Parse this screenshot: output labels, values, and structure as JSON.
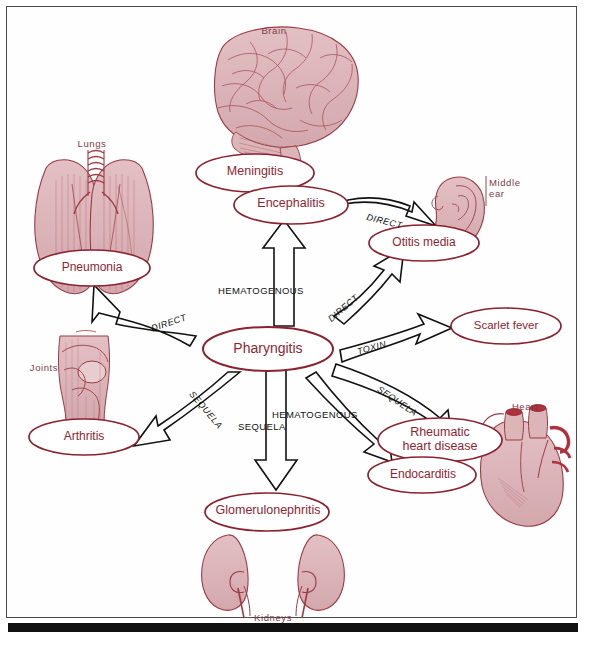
{
  "figure": {
    "frame_color": "#4a4a4a",
    "node_text_color": "#8f2430",
    "node_outline_color": "#8b2230",
    "organ_label_color": "#7d3b45",
    "edge_color": "#111111",
    "organ_fill_color": "#dcb5b9",
    "organ_line_color": "#9c3b44",
    "background_color": "#ffffff"
  },
  "organ_labels": [
    {
      "id": "brain",
      "text": "Brain"
    },
    {
      "id": "lungs",
      "text": "Lungs"
    },
    {
      "id": "middle_ear",
      "text": "Middle\near"
    },
    {
      "id": "joints",
      "text": "Joints"
    },
    {
      "id": "heart",
      "text": "Heart"
    },
    {
      "id": "kidneys",
      "text": "Kidneys"
    }
  ],
  "nodes": [
    {
      "id": "pharyngitis",
      "label": "Pharyngitis",
      "role": "central"
    },
    {
      "id": "meningitis",
      "label": "Meningitis",
      "role": "complication"
    },
    {
      "id": "encephalitis",
      "label": "Encephalitis",
      "role": "complication"
    },
    {
      "id": "otitis_media",
      "label": "Otitis media",
      "role": "complication"
    },
    {
      "id": "scarlet_fever",
      "label": "Scarlet fever",
      "role": "complication"
    },
    {
      "id": "pneumonia",
      "label": "Pneumonia",
      "role": "complication"
    },
    {
      "id": "arthritis",
      "label": "Arthritis",
      "role": "complication"
    },
    {
      "id": "rheumatic_hd",
      "label": "Rheumatic\nheart disease",
      "role": "complication"
    },
    {
      "id": "endocarditis",
      "label": "Endocarditis",
      "role": "complication"
    },
    {
      "id": "glomerulonephritis",
      "label": "Glomerulonephritis",
      "role": "complication"
    }
  ],
  "edges": [
    {
      "id": "e_brain",
      "from": "pharyngitis",
      "to": "encephalitis",
      "label": "HEMATOGENOUS"
    },
    {
      "id": "e_ear",
      "from": "pharyngitis",
      "to": "otitis_media",
      "label": "DIRECT"
    },
    {
      "id": "e_ear_upper",
      "from": "encephalitis",
      "to": "otitis_media",
      "label": "DIRECT"
    },
    {
      "id": "e_scarlet",
      "from": "pharyngitis",
      "to": "scarlet_fever",
      "label": "TOXIN"
    },
    {
      "id": "e_lungs",
      "from": "pharyngitis",
      "to": "pneumonia",
      "label": "DIRECT"
    },
    {
      "id": "e_joints",
      "from": "pharyngitis",
      "to": "arthritis",
      "label": "SEQUELA"
    },
    {
      "id": "e_rheumatic",
      "from": "pharyngitis",
      "to": "rheumatic_hd",
      "label": "SEQUELA"
    },
    {
      "id": "e_endocarditis",
      "from": "pharyngitis",
      "to": "endocarditis",
      "label": "HEMATOGENOUS"
    },
    {
      "id": "e_kidneys",
      "from": "pharyngitis",
      "to": "glomerulonephritis",
      "label": "SEQUELA"
    }
  ]
}
